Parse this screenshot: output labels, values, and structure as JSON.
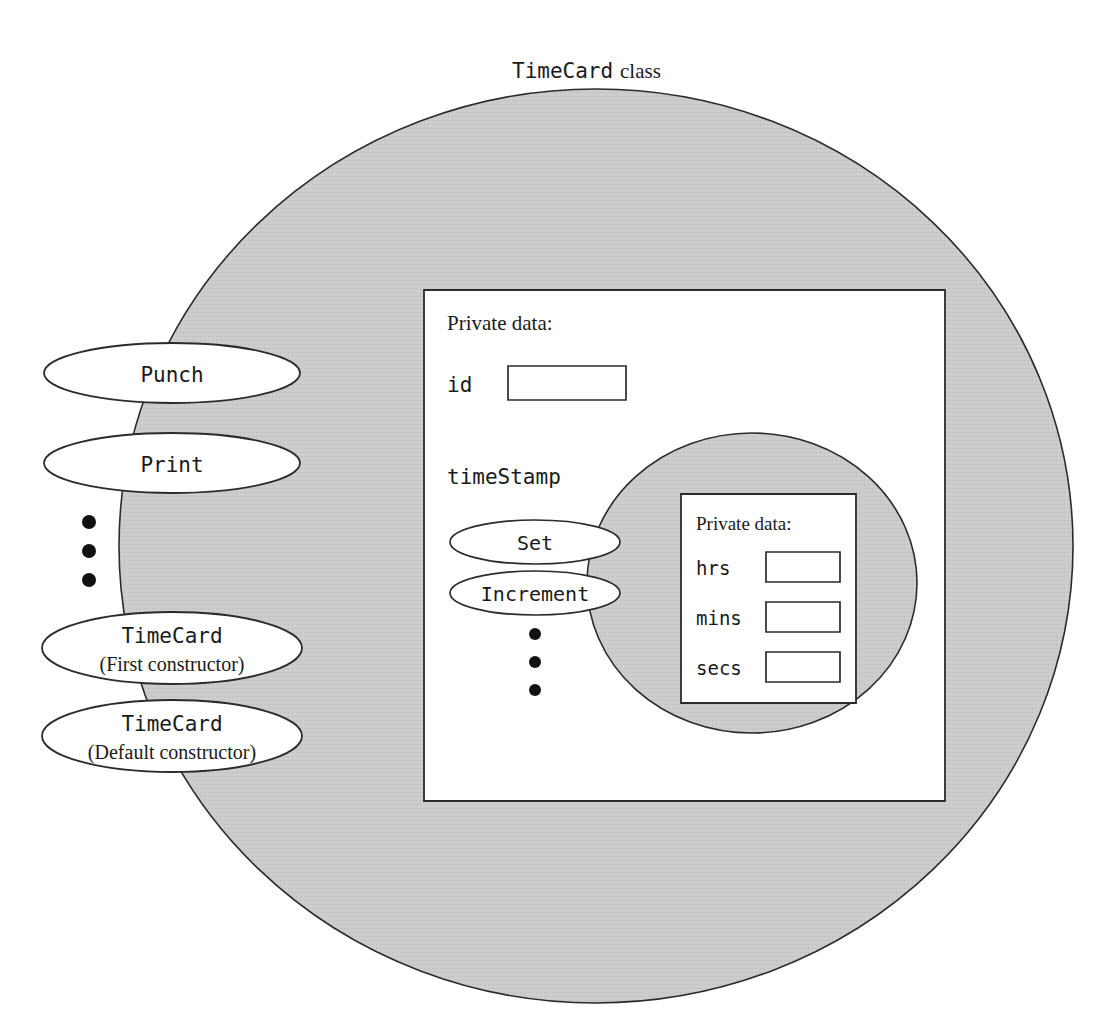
{
  "diagram": {
    "title_mono": "TimeCard",
    "title_serif": "class",
    "outer_class_label": "TimeCard class"
  },
  "colors": {
    "gray_fill": "#c9c9c9",
    "white_fill": "#ffffff",
    "outline": "#2b2b2b",
    "text": "#1a1a1a"
  },
  "outer_circle": {
    "name": "TimeCard class region",
    "fill": "#c9c9c9"
  },
  "member_functions": [
    {
      "id": "punch",
      "line1": "Punch",
      "line2": "",
      "line1_style": "mono",
      "line2_style": "serif"
    },
    {
      "id": "print",
      "line1": "Print",
      "line2": "",
      "line1_style": "mono",
      "line2_style": "serif"
    },
    {
      "id": "timecard-first",
      "line1": "TimeCard",
      "line2": "(First constructor)",
      "line1_style": "mono",
      "line2_style": "serif"
    },
    {
      "id": "timecard-default",
      "line1": "TimeCard",
      "line2": "(Default constructor)",
      "line1_style": "mono",
      "line2_style": "serif"
    }
  ],
  "ellipsis_outer": "•",
  "private_data_block": {
    "heading": "Private data:",
    "fields": [
      {
        "name": "id",
        "value": ""
      },
      {
        "name": "timeStamp",
        "value": ""
      }
    ]
  },
  "timestamp_object": {
    "member_functions": [
      {
        "id": "set",
        "label": "Set"
      },
      {
        "id": "increment",
        "label": "Increment"
      }
    ],
    "ellipsis": "•",
    "private_data_block": {
      "heading": "Private data:",
      "fields": [
        {
          "name": "hrs",
          "value": ""
        },
        {
          "name": "mins",
          "value": ""
        },
        {
          "name": "secs",
          "value": ""
        }
      ]
    }
  }
}
